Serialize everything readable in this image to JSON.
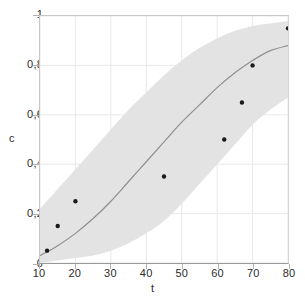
{
  "chart_data": {
    "type": "line",
    "title": "",
    "subtitle": "",
    "xlabel": "t",
    "ylabel": "c",
    "xlim": [
      10,
      80
    ],
    "ylim": [
      0,
      1
    ],
    "grid": true,
    "legend": null,
    "legend_position": "none",
    "decimal_separator": ",",
    "xticks": [
      {
        "value": 10,
        "label": "10"
      },
      {
        "value": 20,
        "label": "20"
      },
      {
        "value": 30,
        "label": "30"
      },
      {
        "value": 40,
        "label": "40"
      },
      {
        "value": 50,
        "label": "50"
      },
      {
        "value": 60,
        "label": "60"
      },
      {
        "value": 70,
        "label": "70"
      },
      {
        "value": 80,
        "label": "80"
      }
    ],
    "yticks": [
      {
        "value": 0,
        "label": "0"
      },
      {
        "value": 0.2,
        "label": "0,2"
      },
      {
        "value": 0.4,
        "label": "0,4"
      },
      {
        "value": 0.6,
        "label": "0,6"
      },
      {
        "value": 0.8,
        "label": "0,8"
      },
      {
        "value": 1,
        "label": "1"
      }
    ],
    "colors": {
      "band_fill": "#e3e3e3",
      "fit_line": "#8f8f8f",
      "points": "#1a1a1a",
      "grid": "#e8e8e8",
      "axis": "#999999",
      "text": "#2b2b2b",
      "background": "#ffffff"
    },
    "series": [
      {
        "name": "fit-curve",
        "type": "line",
        "x": [
          10,
          15,
          20,
          25,
          30,
          35,
          40,
          45,
          50,
          55,
          60,
          65,
          70,
          75,
          80
        ],
        "values": [
          0.03,
          0.07,
          0.12,
          0.18,
          0.25,
          0.33,
          0.41,
          0.49,
          0.57,
          0.64,
          0.71,
          0.77,
          0.82,
          0.86,
          0.88
        ]
      },
      {
        "name": "confidence-band-upper",
        "type": "line",
        "x": [
          10,
          15,
          20,
          25,
          30,
          35,
          40,
          45,
          50,
          55,
          60,
          65,
          70,
          75,
          80
        ],
        "values": [
          0.22,
          0.3,
          0.38,
          0.46,
          0.54,
          0.62,
          0.69,
          0.76,
          0.82,
          0.87,
          0.91,
          0.94,
          0.96,
          0.97,
          0.98
        ]
      },
      {
        "name": "confidence-band-lower",
        "type": "line",
        "x": [
          10,
          15,
          20,
          25,
          30,
          35,
          40,
          45,
          50,
          55,
          60,
          65,
          70,
          75,
          80
        ],
        "values": [
          0.0,
          0.01,
          0.02,
          0.03,
          0.05,
          0.08,
          0.12,
          0.17,
          0.24,
          0.32,
          0.4,
          0.48,
          0.56,
          0.62,
          0.67
        ]
      },
      {
        "name": "observed-points",
        "type": "scatter",
        "x": [
          12,
          15,
          20,
          45,
          62,
          67,
          70,
          80
        ],
        "values": [
          0.05,
          0.15,
          0.25,
          0.35,
          0.5,
          0.65,
          0.8,
          0.95
        ]
      }
    ]
  }
}
